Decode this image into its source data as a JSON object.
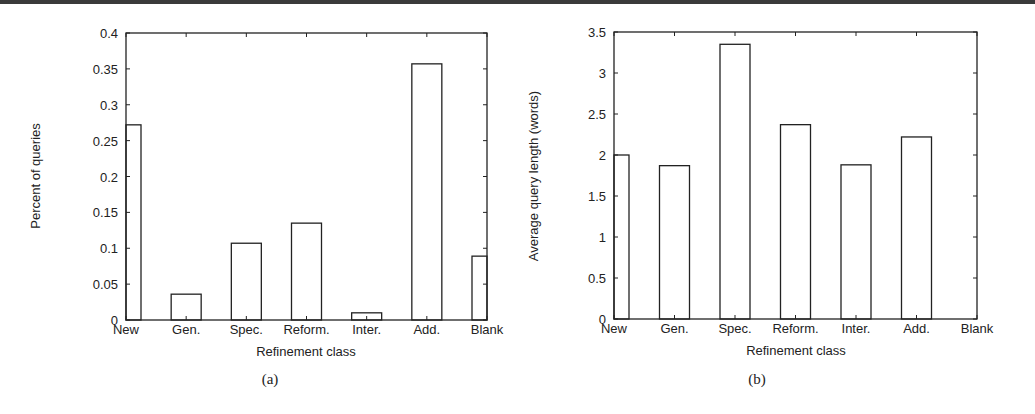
{
  "chart_data": [
    {
      "panel": "(a)",
      "type": "bar",
      "title": "",
      "xlabel": "Refinement class",
      "ylabel": "Percent of queries",
      "categories": [
        "New",
        "Gen.",
        "Spec.",
        "Reform.",
        "Inter.",
        "Add.",
        "Blank"
      ],
      "values": [
        0.272,
        0.036,
        0.107,
        0.135,
        0.01,
        0.357,
        0.089
      ],
      "ylim": [
        0,
        0.4
      ],
      "yticks": [
        "0",
        "0.05",
        "0.1",
        "0.15",
        "0.2",
        "0.25",
        "0.3",
        "0.35",
        "0.4"
      ],
      "grid": false,
      "legend": null
    },
    {
      "panel": "(b)",
      "type": "bar",
      "title": "",
      "xlabel": "Refinement class",
      "ylabel": "Average query length (words)",
      "categories": [
        "New",
        "Gen.",
        "Spec.",
        "Reform.",
        "Inter.",
        "Add.",
        "Blank"
      ],
      "values": [
        2.0,
        1.87,
        3.35,
        2.37,
        1.88,
        2.22,
        0
      ],
      "ylim": [
        0,
        3.5
      ],
      "yticks": [
        "0",
        "0.5",
        "1",
        "1.5",
        "2",
        "2.5",
        "3",
        "3.5"
      ],
      "grid": false,
      "legend": null
    }
  ],
  "panels": [
    {
      "caption": "(a)",
      "xlabel": "Refinement class",
      "ylabel": "Percent of queries",
      "categories": [
        "New",
        "Gen.",
        "Spec.",
        "Reform.",
        "Inter.",
        "Add.",
        "Blank"
      ],
      "yticks": [
        "0",
        "0.05",
        "0.1",
        "0.15",
        "0.2",
        "0.25",
        "0.3",
        "0.35",
        "0.4"
      ]
    },
    {
      "caption": "(b)",
      "xlabel": "Refinement class",
      "ylabel": "Average query length (words)",
      "categories": [
        "New",
        "Gen.",
        "Spec.",
        "Reform.",
        "Inter.",
        "Add.",
        "Blank"
      ],
      "yticks": [
        "0",
        "0.5",
        "1",
        "1.5",
        "2",
        "2.5",
        "3",
        "3.5"
      ]
    }
  ],
  "colors": {
    "axis": "#222222",
    "bar_fill": "#ffffff",
    "bar_stroke": "#222222",
    "top_rule": "#3a3a3a"
  }
}
